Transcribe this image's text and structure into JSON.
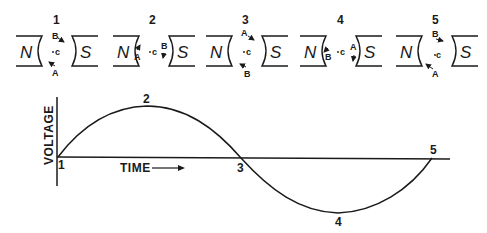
{
  "diagram": {
    "positions": [
      {
        "number": "1",
        "north": "N",
        "south": "S",
        "center": "c",
        "top_label": "B",
        "bottom_label": "A"
      },
      {
        "number": "2",
        "north": "N",
        "south": "S",
        "center": "c",
        "left_label": "A",
        "right_label": "B"
      },
      {
        "number": "3",
        "north": "N",
        "south": "S",
        "center": "c",
        "top_label": "A",
        "bottom_label": "B"
      },
      {
        "number": "4",
        "north": "N",
        "south": "S",
        "center": "c",
        "left_label": "B",
        "right_label": "A"
      },
      {
        "number": "5",
        "north": "N",
        "south": "S",
        "center": "c",
        "top_label": "B",
        "bottom_label": "A"
      }
    ],
    "graph": {
      "y_axis_label": "VOLTAGE",
      "x_axis_label": "TIME",
      "arrow": "→",
      "point_labels": [
        "1",
        "2",
        "3",
        "4",
        "5"
      ]
    }
  }
}
